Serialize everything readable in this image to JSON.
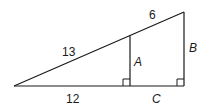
{
  "diagram": {
    "type": "similar-right-triangles",
    "labels": {
      "hypotenuse_small": "13",
      "hypotenuse_extension": "6",
      "base_small": "12",
      "base_extension": "C",
      "inner_leg": "A",
      "outer_leg": "B"
    },
    "right_angles": [
      "inner-foot",
      "outer-foot"
    ],
    "colors": {
      "stroke": "#1a1a1a",
      "background": "#ffffff"
    }
  }
}
